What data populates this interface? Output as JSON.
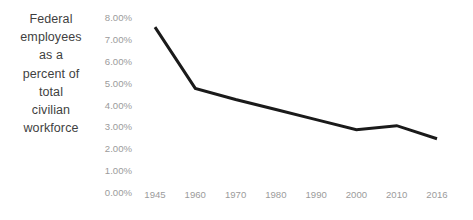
{
  "chart_data": {
    "type": "line",
    "title": "Federal employees as a percent of total civilian workforce",
    "title_lines": [
      "Federal",
      "employees",
      "as a",
      "percent of",
      "total",
      "civilian",
      "workforce"
    ],
    "xlabel": "",
    "ylabel": "",
    "categories": [
      "1945",
      "1960",
      "1970",
      "1980",
      "1990",
      "2000",
      "2010",
      "2016"
    ],
    "values": [
      7.55,
      4.5,
      3.95,
      3.45,
      2.95,
      2.45,
      2.65,
      2.0
    ],
    "series": [
      {
        "name": "Federal employees as a percent of total civilian workforce",
        "values": [
          7.55,
          4.5,
          3.95,
          3.45,
          2.95,
          2.45,
          2.65,
          2.0
        ]
      }
    ],
    "ylim": [
      0,
      8
    ],
    "ytick_values": [
      8,
      7,
      6,
      5,
      4,
      3,
      2,
      1,
      0
    ],
    "ytick_labels": [
      "8.00%",
      "7.00%",
      "6.00%",
      "5.00%",
      "4.00%",
      "3.00%",
      "2.00%",
      "1.00%",
      "0.00%"
    ],
    "xtick_labels": [
      "1945",
      "1960",
      "1970",
      "1980",
      "1990",
      "2000",
      "2010",
      "2016"
    ],
    "grid": false,
    "axis_lines": false,
    "markers": false,
    "legend": null,
    "legend_position": "none",
    "annotations": [],
    "colors": {
      "line": "#1a1a1a",
      "title_text": "#3f3f3f",
      "tick_text": "#9b9b9b",
      "background": "#ffffff"
    },
    "line_width": 3
  }
}
